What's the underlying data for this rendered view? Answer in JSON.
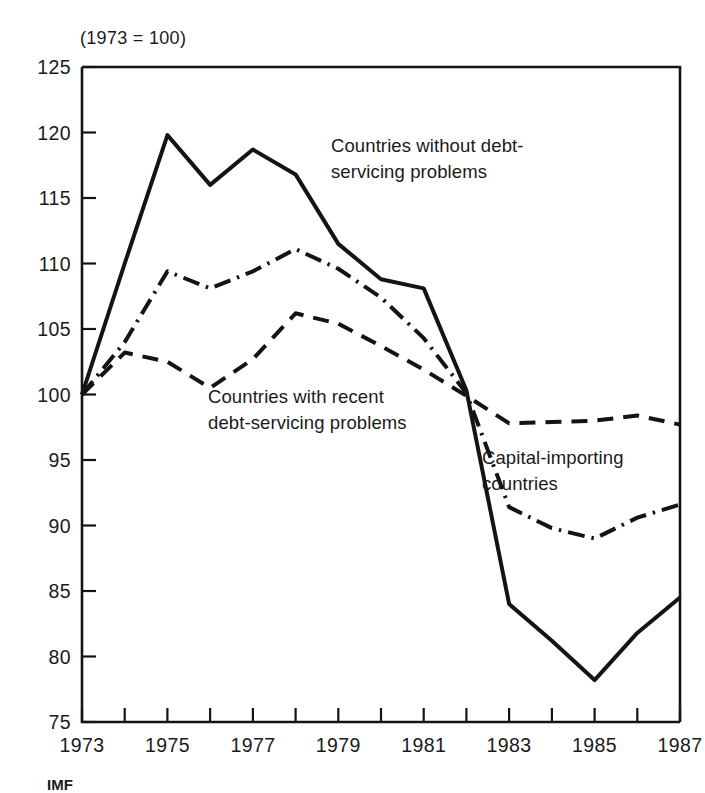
{
  "figure": {
    "unit_title": "(1973 = 100)",
    "source_note": "IMF"
  },
  "chart_data": {
    "type": "line",
    "title": "(1973 = 100)",
    "xlabel": "",
    "ylabel": "",
    "xlim": [
      1973,
      1987
    ],
    "ylim": [
      75,
      125
    ],
    "yticks": [
      75,
      80,
      85,
      90,
      95,
      100,
      105,
      110,
      115,
      120,
      125
    ],
    "ytick_labels": [
      "75",
      "80",
      "85",
      "90",
      "95",
      "100",
      "105",
      "110",
      "115",
      "120",
      "125"
    ],
    "xticks": [
      1973,
      1974,
      1975,
      1976,
      1977,
      1978,
      1979,
      1980,
      1981,
      1982,
      1983,
      1984,
      1985,
      1986,
      1987
    ],
    "xtick_labels": [
      "1973",
      "",
      "1975",
      "",
      "1977",
      "",
      "1979",
      "",
      "1981",
      "",
      "1983",
      "",
      "1985",
      "",
      "1987"
    ],
    "x": [
      1973,
      1974,
      1975,
      1976,
      1977,
      1978,
      1979,
      1980,
      1981,
      1982,
      1983,
      1984,
      1985,
      1986,
      1987
    ],
    "grid": false,
    "legend": "inline annotations",
    "series": [
      {
        "name": "Countries without debt-servicing problems",
        "style": "solid",
        "values": [
          100.0,
          110.0,
          119.8,
          116.0,
          118.7,
          116.8,
          111.5,
          108.8,
          108.1,
          100.3,
          84.0,
          81.2,
          78.2,
          81.8,
          84.5
        ]
      },
      {
        "name": "Capital-importing countries",
        "style": "dash-dot",
        "values": [
          100.0,
          104.0,
          109.4,
          108.1,
          109.4,
          111.1,
          109.6,
          107.4,
          104.3,
          100.1,
          91.4,
          89.8,
          89.0,
          90.6,
          91.6
        ]
      },
      {
        "name": "Countries with recent debt-servicing problems",
        "style": "dashed",
        "values": [
          100.0,
          103.2,
          102.5,
          100.5,
          102.7,
          106.2,
          105.4,
          103.7,
          101.9,
          99.9,
          97.8,
          97.9,
          98.0,
          98.4,
          97.7
        ]
      }
    ],
    "annotations": [
      {
        "name": "countries-without-debt-servicing-problems",
        "lines": [
          "Countries without debt-",
          "servicing problems"
        ],
        "x": 331,
        "y": 152
      },
      {
        "name": "countries-with-recent-debt-servicing-problems",
        "lines": [
          "Countries with recent",
          "debt-servicing problems"
        ],
        "x": 208,
        "y": 403
      },
      {
        "name": "capital-importing-countries",
        "lines": [
          "Capital-importing",
          "countries"
        ],
        "x": 482,
        "y": 464
      }
    ]
  }
}
